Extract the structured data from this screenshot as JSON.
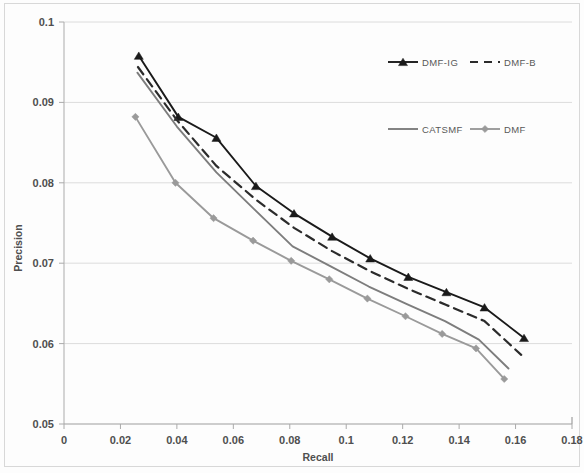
{
  "chart_data": {
    "type": "line",
    "title": "",
    "xlabel": "Recall",
    "ylabel": "Precision",
    "xlim": [
      0,
      0.18
    ],
    "ylim": [
      0.05,
      0.1
    ],
    "xticks": [
      "0",
      "0.02",
      "0.04",
      "0.06",
      "0.08",
      "0.1",
      "0.12",
      "0.14",
      "0.16",
      "0.18"
    ],
    "yticks": [
      "0.05",
      "0.06",
      "0.07",
      "0.08",
      "0.09",
      "0.1"
    ],
    "grid": "horizontal",
    "legend_position": "upper-right-inside",
    "series": [
      {
        "name": "DMF-IG",
        "color": "#1a1a1a",
        "style": "solid",
        "marker": "triangle",
        "x": [
          0.0265,
          0.0405,
          0.054,
          0.068,
          0.0815,
          0.095,
          0.1085,
          0.122,
          0.1355,
          0.149,
          0.163
        ],
        "y": [
          0.0958,
          0.0882,
          0.0856,
          0.0796,
          0.0762,
          0.0733,
          0.0706,
          0.0683,
          0.0664,
          0.0645,
          0.0607
        ]
      },
      {
        "name": "DMF-B",
        "color": "#2b2b2b",
        "style": "dashed",
        "marker": "none",
        "x": [
          0.0262,
          0.04,
          0.054,
          0.068,
          0.0815,
          0.095,
          0.1085,
          0.122,
          0.1355,
          0.149,
          0.162
        ],
        "y": [
          0.0944,
          0.0878,
          0.0821,
          0.0779,
          0.0744,
          0.0715,
          0.069,
          0.0668,
          0.0648,
          0.0628,
          0.0586
        ]
      },
      {
        "name": "CATSMF",
        "color": "#7d7d7d",
        "style": "solid",
        "marker": "none",
        "x": [
          0.026,
          0.04,
          0.054,
          0.068,
          0.081,
          0.0945,
          0.108,
          0.1215,
          0.135,
          0.147,
          0.1575
        ],
        "y": [
          0.0937,
          0.087,
          0.0813,
          0.0765,
          0.0721,
          0.0696,
          0.0671,
          0.0649,
          0.0628,
          0.0605,
          0.0569
        ]
      },
      {
        "name": "DMF",
        "color": "#9a9a9a",
        "style": "solid",
        "marker": "diamond",
        "x": [
          0.0253,
          0.0395,
          0.053,
          0.067,
          0.0805,
          0.094,
          0.1075,
          0.121,
          0.134,
          0.146,
          0.156
        ],
        "y": [
          0.0882,
          0.08,
          0.0756,
          0.0728,
          0.0703,
          0.068,
          0.0656,
          0.0634,
          0.0612,
          0.0594,
          0.0556
        ]
      }
    ]
  },
  "legend": {
    "items": [
      {
        "label": "DMF-IG"
      },
      {
        "label": "DMF-B"
      },
      {
        "label": "CATSMF"
      },
      {
        "label": "DMF"
      }
    ]
  },
  "axes": {
    "x_title": "Recall",
    "y_title": "Precision"
  }
}
